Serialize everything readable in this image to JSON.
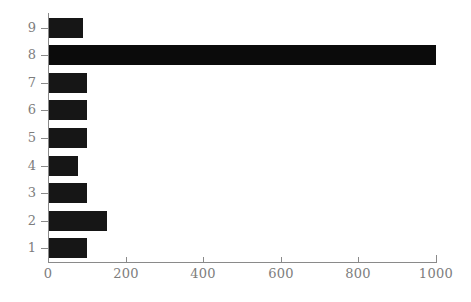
{
  "chart_data": {
    "type": "bar",
    "orientation": "horizontal",
    "title": "",
    "xlabel": "",
    "ylabel": "",
    "categories": [
      "1",
      "2",
      "3",
      "4",
      "5",
      "6",
      "7",
      "8",
      "9"
    ],
    "values": [
      100,
      152,
      100,
      78,
      100,
      100,
      100,
      1000,
      90
    ],
    "series": [
      {
        "name": "count",
        "values": [
          100,
          152,
          100,
          78,
          100,
          100,
          100,
          1000,
          90
        ]
      }
    ],
    "xlim": [
      0,
      1000
    ],
    "xticks": [
      0,
      200,
      400,
      600,
      800,
      1000
    ],
    "xtick_labels": [
      "0",
      "200",
      "400",
      "600",
      "800",
      "1000"
    ],
    "yticks": [
      1,
      2,
      3,
      4,
      5,
      6,
      7,
      8,
      9
    ],
    "ytick_labels": [
      "1",
      "2",
      "3",
      "4",
      "5",
      "6",
      "7",
      "8",
      "9"
    ],
    "grid": false,
    "legend": null,
    "bar_color": "#161616",
    "axis_color": "#8a8a8a",
    "tick_label_color": "#7d7d7d",
    "background_color": "#ffffff",
    "bars": [
      {
        "category": "9",
        "value": 90,
        "label": "9"
      },
      {
        "category": "8",
        "value": 1000,
        "label": "8"
      },
      {
        "category": "7",
        "value": 100,
        "label": "7"
      },
      {
        "category": "6",
        "value": 100,
        "label": "6"
      },
      {
        "category": "5",
        "value": 100,
        "label": "5"
      },
      {
        "category": "4",
        "value": 78,
        "label": "4"
      },
      {
        "category": "3",
        "value": 100,
        "label": "3"
      },
      {
        "category": "2",
        "value": 152,
        "label": "2"
      },
      {
        "category": "1",
        "value": 100,
        "label": "1"
      }
    ]
  }
}
